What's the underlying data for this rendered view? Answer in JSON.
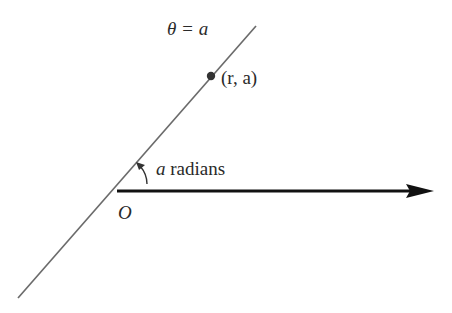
{
  "diagram": {
    "labels": {
      "ray_equation": "θ = a",
      "point": "(r, a)",
      "angle_var": "a",
      "angle_unit": " radians",
      "origin": "O"
    },
    "colors": {
      "ray": "#6b6b6b",
      "axis": "#111111",
      "point": "#333333",
      "text": "#2a2a2a"
    },
    "geometry": {
      "ray_start": [
        18,
        298
      ],
      "ray_end": [
        256,
        26
      ],
      "origin": [
        117,
        191
      ],
      "axis_end": [
        432,
        191
      ],
      "point": [
        211,
        76
      ]
    }
  }
}
